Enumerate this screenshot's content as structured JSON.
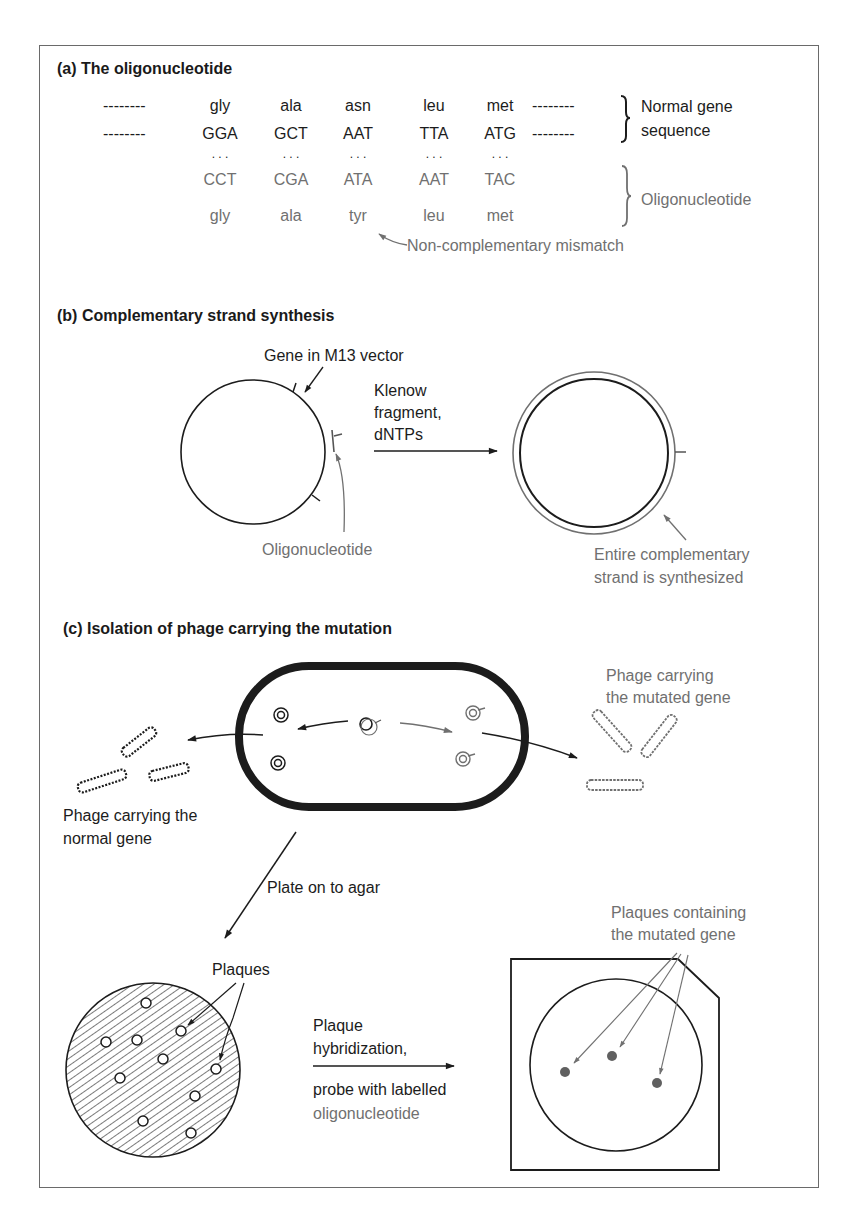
{
  "colors": {
    "ink": "#1c1c1c",
    "highlight_gray": "#707070",
    "frame": "#6a6a6a",
    "background": "#ffffff"
  },
  "panel_a": {
    "title": "(a)  The oligonucleotide",
    "dashes": "--------",
    "normal_amino_acids": [
      "gly",
      "ala",
      "asn",
      "leu",
      "met"
    ],
    "normal_codons": [
      "GGA",
      "GCT",
      "AAT",
      "TTA",
      "ATG"
    ],
    "pairing_dots": ". . .",
    "oligo_codons": [
      "CCT",
      "CGA",
      "ATA",
      "AAT",
      "TAC"
    ],
    "oligo_amino_acids": [
      "gly",
      "ala",
      "tyr",
      "leu",
      "met"
    ],
    "brace_normal_label": [
      "Normal gene",
      "sequence"
    ],
    "brace_oligo_label": "Oligonucleotide",
    "mismatch_label": "Non-complementary mismatch"
  },
  "panel_b": {
    "title": "(b)  Complementary strand synthesis",
    "gene_label": "Gene in M13 vector",
    "reaction_label": [
      "Klenow",
      "fragment,",
      "dNTPs"
    ],
    "oligo_label": "Oligonucleotide",
    "result_label": [
      "Entire complementary",
      "strand is synthesized"
    ]
  },
  "panel_c": {
    "title": "(c)  Isolation of phage carrying the mutation",
    "mutated_phage_label": [
      "Phage carrying",
      "the mutated gene"
    ],
    "normal_phage_label": [
      "Phage carrying the",
      "normal gene"
    ],
    "plate_label": "Plate on to agar",
    "plaques_label": "Plaques",
    "hybridization_label": [
      "Plaque",
      "hybridization,"
    ],
    "probe_label": "probe with labelled",
    "probe_label_2": "oligonucleotide",
    "mutated_plaques_label": [
      "Plaques containing",
      "the mutated gene"
    ]
  }
}
